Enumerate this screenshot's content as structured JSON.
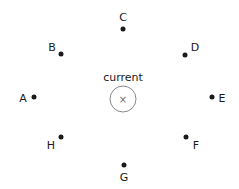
{
  "diagram": {
    "background_color": "#ffffff",
    "dot_color": "#1a1a1a",
    "label_color": "#1a1a1a",
    "circle_stroke_color": "#8a8a8a",
    "current": {
      "label": "current",
      "symbol": "×",
      "label_x": 123,
      "label_y": 77,
      "circle_x": 123,
      "circle_y": 99,
      "circle_radius": 13
    },
    "points": [
      {
        "label": "A",
        "dot_x": 34,
        "dot_y": 97,
        "label_x": 23,
        "label_y": 98
      },
      {
        "label": "B",
        "dot_x": 61,
        "dot_y": 54,
        "label_x": 52,
        "label_y": 47
      },
      {
        "label": "C",
        "dot_x": 123,
        "dot_y": 29,
        "label_x": 123,
        "label_y": 17
      },
      {
        "label": "D",
        "dot_x": 185,
        "dot_y": 55,
        "label_x": 195,
        "label_y": 47
      },
      {
        "label": "E",
        "dot_x": 212,
        "dot_y": 97,
        "label_x": 222,
        "label_y": 98
      },
      {
        "label": "F",
        "dot_x": 186,
        "dot_y": 137,
        "label_x": 196,
        "label_y": 145
      },
      {
        "label": "G",
        "dot_x": 124,
        "dot_y": 165,
        "label_x": 124,
        "label_y": 177
      },
      {
        "label": "H",
        "dot_x": 61,
        "dot_y": 137,
        "label_x": 51,
        "label_y": 145
      }
    ]
  }
}
